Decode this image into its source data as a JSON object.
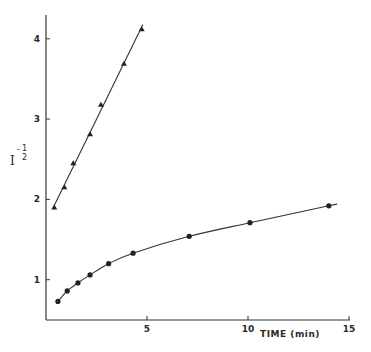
{
  "chart_data": {
    "type": "line",
    "title": "",
    "xlabel": "TIME (min)",
    "ylabel": "I^(-1/2)",
    "ylabel_parts": {
      "base": "I",
      "sign": "-",
      "num": "1",
      "den": "2"
    },
    "xlim": [
      0,
      15
    ],
    "ylim": [
      0.5,
      4.3
    ],
    "x_ticks": [
      5,
      10,
      15
    ],
    "x_tick_labels": [
      "5",
      "10",
      "15"
    ],
    "y_ticks": [
      1,
      2,
      3,
      4
    ],
    "y_tick_labels": [
      "1",
      "2",
      "3",
      "4"
    ],
    "grid": false,
    "legend": null,
    "series": [
      {
        "name": "triangles",
        "marker": "triangle",
        "fit": "linear",
        "x": [
          0.41,
          0.91,
          1.35,
          2.18,
          2.72,
          3.86,
          4.74
        ],
        "y": [
          1.9,
          2.15,
          2.45,
          2.81,
          3.18,
          3.69,
          4.12
        ]
      },
      {
        "name": "circles",
        "marker": "circle",
        "fit": "smooth curve",
        "x": [
          0.59,
          1.05,
          1.58,
          2.18,
          3.1,
          4.31,
          7.09,
          10.1,
          14.0
        ],
        "y": [
          0.73,
          0.86,
          0.96,
          1.06,
          1.2,
          1.33,
          1.54,
          1.71,
          1.92
        ]
      }
    ]
  }
}
